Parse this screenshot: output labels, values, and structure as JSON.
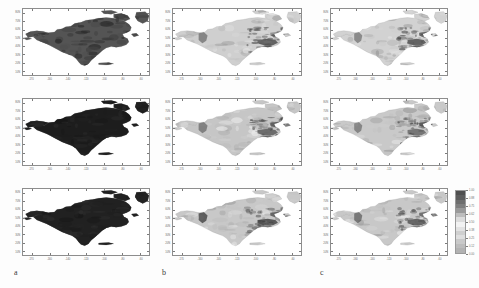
{
  "figure": {
    "title": "",
    "panel_letters": [
      {
        "label": "a",
        "x": 14,
        "y": 268
      },
      {
        "label": "b",
        "x": 162,
        "y": 268
      },
      {
        "label": "c",
        "x": 320,
        "y": 268
      }
    ]
  },
  "axis": {
    "xticklabels": [
      "-170",
      "-160",
      "-140",
      "-120",
      "-100",
      "-80",
      "-60"
    ],
    "yticklabels": [
      "80N",
      "70N",
      "60N",
      "50N",
      "40N",
      "30N",
      "20N",
      "10N"
    ],
    "xlabel": "",
    "ylabel": ""
  },
  "colorbar": {
    "ticklabels": [
      "1.00",
      "0.88",
      "0.75",
      "0.62",
      "0.50",
      "0.38",
      "0.25",
      "0.12",
      "0.00"
    ],
    "orientation": "vertical",
    "high_color": "#4a4a4a",
    "low_color": "#f5f5f5"
  },
  "chart_data": {
    "type": "heatmap",
    "title": "",
    "subtitle": "",
    "xlabel": "Longitude",
    "ylabel": "Latitude",
    "xlim": [
      -172,
      -52
    ],
    "ylim": [
      8,
      84
    ],
    "grid": false,
    "legend_position": "right",
    "colormap": "greys",
    "region": "North America",
    "columns": [
      "a",
      "b",
      "c"
    ],
    "rows": [
      "row1",
      "row2",
      "row3"
    ],
    "panels": [
      {
        "id": "a1",
        "column": "a",
        "row": 1,
        "mean_value": 0.72,
        "coverage": "continent-wide dense dark coverage, heaviest over central/eastern Canada, Rockies and eastern US",
        "land_tone": "#6f6f6f"
      },
      {
        "id": "b1",
        "column": "b",
        "row": 1,
        "mean_value": 0.22,
        "coverage": "light uniform grey over continent with darker patches over Great Lakes, Quebec and Pacific Northwest coast",
        "land_tone": "#cfcfcf"
      },
      {
        "id": "c1",
        "column": "c",
        "row": 1,
        "mean_value": 0.2,
        "coverage": "light uniform grey with dark patches over Great Lakes, Labrador and coastal ranges",
        "land_tone": "#d2d2d2"
      },
      {
        "id": "a2",
        "column": "a",
        "row": 2,
        "mean_value": 0.92,
        "coverage": "near-saturated dark coverage across entire landmass",
        "land_tone": "#3c3c3c"
      },
      {
        "id": "b2",
        "column": "b",
        "row": 2,
        "mean_value": 0.3,
        "coverage": "mid-light grey continent with dark eastern Canada and Appalachians",
        "land_tone": "#c6c6c6"
      },
      {
        "id": "c2",
        "column": "c",
        "row": 2,
        "mean_value": 0.28,
        "coverage": "mid-light grey continent with dark northeast and Great Lakes band",
        "land_tone": "#c9c9c9"
      },
      {
        "id": "a3",
        "column": "a",
        "row": 3,
        "mean_value": 0.9,
        "coverage": "near-saturated dark coverage across entire landmass",
        "land_tone": "#3f3f3f"
      },
      {
        "id": "b3",
        "column": "b",
        "row": 3,
        "mean_value": 0.32,
        "coverage": "light grey continent, dark Great Lakes / Quebec region and west coast strip",
        "land_tone": "#c8c8c8"
      },
      {
        "id": "c3",
        "column": "c",
        "row": 3,
        "mean_value": 0.33,
        "coverage": "light grey continent, dark Great Lakes / Quebec region, colorbar attached",
        "land_tone": "#c8c8c8"
      }
    ],
    "value_range": [
      0.0,
      1.0
    ]
  }
}
